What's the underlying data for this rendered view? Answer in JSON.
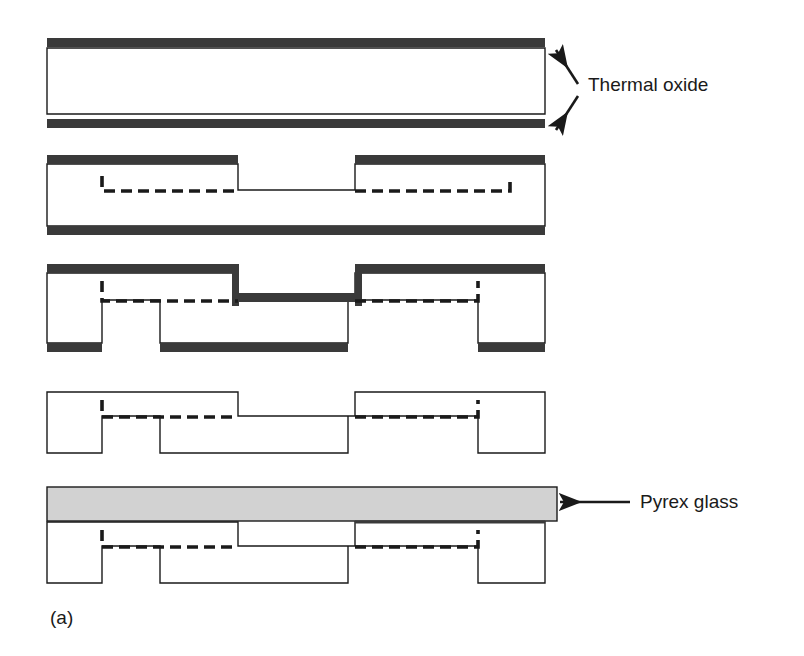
{
  "figure": {
    "caption": "(a)",
    "panel_count": 5
  },
  "annotations": [
    {
      "id": "thermal-oxide",
      "label": "Thermal oxide",
      "text_x": 588,
      "text_y": 91,
      "arrows": [
        {
          "x1": 578,
          "y1": 84,
          "x2": 556,
          "y2": 50
        },
        {
          "x1": 578,
          "y1": 96,
          "x2": 556,
          "y2": 130
        }
      ]
    },
    {
      "id": "pyrex-glass",
      "label": "Pyrex glass",
      "text_x": 640,
      "text_y": 508,
      "arrows": [
        {
          "x1": 630,
          "y1": 502,
          "x2": 560,
          "y2": 502
        }
      ]
    }
  ],
  "colors": {
    "oxide": "#3a3a3a",
    "glass": "#d2d2d2",
    "outline": "#1a1a1a",
    "background": "#ffffff",
    "text": "#1a1a1a"
  },
  "geometry": {
    "left": 47,
    "right": 545,
    "oxide_thickness": 9,
    "line_width": 1.4,
    "dash_pattern": "11,6",
    "dash_width": 3.6
  },
  "panels": [
    {
      "index": 1,
      "name": "panel-thermal-oxidation",
      "step": "Thermal oxidation of bare silicon wafer",
      "top_oxide_y": 38,
      "body_top_y": 48,
      "body_bottom_y": 114,
      "bottom_oxide_y": 119,
      "top_oxide_segments": [
        [
          47,
          545
        ]
      ],
      "bottom_oxide_segments": [
        [
          47,
          545
        ]
      ],
      "silicon_outline": "M47,48 L545,48 L545,114 L47,114 Z",
      "dashed_paths": []
    },
    {
      "index": 2,
      "name": "panel-oxide-patterning",
      "step": "Photolithographic patterning and opening of top oxide window",
      "top_oxide_y": 155,
      "body_top_y": 164,
      "body_bottom_y": 226,
      "bottom_oxide_y": 226,
      "top_oxide_segments": [
        [
          47,
          238
        ],
        [
          355,
          545
        ]
      ],
      "bottom_oxide_segments": [
        [
          47,
          545
        ]
      ],
      "silicon_outline": "M47,164 L238,164 L238,190 L355,190 L355,164 L545,164 L545,226 L47,226 Z",
      "dashed_paths": [
        "M102,176 L102,191 L238,191",
        "M355,191 L510,191 L510,176"
      ]
    },
    {
      "index": 3,
      "name": "panel-double-sided-etch",
      "step": "Double-sided anisotropic etch forming top recess and backside wells",
      "top_oxide_y": 264,
      "body_top_y": 273,
      "body_bottom_y": 343,
      "bottom_oxide_y": 343,
      "top_oxide_segments": [
        [
          47,
          238
        ],
        [
          355,
          545
        ]
      ],
      "bottom_oxide_segments": [
        [
          47,
          102
        ],
        [
          160,
          348
        ],
        [
          478,
          545
        ]
      ],
      "silicon_outline": "M47,273 L238,273 L238,300 L355,300 L355,273 L545,273 L545,343 L478,343 L478,300 L348,300 L348,343 L160,343 L160,300 L102,300 L102,343 L47,343 Z",
      "dashed_paths": [
        "M102,281 L102,301 L238,301",
        "M355,301 L478,301 L478,281"
      ]
    },
    {
      "index": 4,
      "name": "panel-oxide-strip",
      "step": "Oxide removal leaving shaped silicon structure",
      "body_top_y": 392,
      "body_bottom_y": 453,
      "top_oxide_segments": [],
      "bottom_oxide_segments": [],
      "silicon_outline": "M47,392 L238,392 L238,416 L355,416 L355,392 L545,392 L545,453 L478,453 L478,416 L348,416 L348,453 L160,453 L160,416 L102,416 L102,453 L47,453 Z",
      "dashed_paths": [
        "M102,400 L102,417 L238,417",
        "M355,417 L478,417 L478,400"
      ]
    },
    {
      "index": 5,
      "name": "panel-anodic-bonding",
      "step": "Anodic bonding of Pyrex glass cover to silicon",
      "glass_top_y": 487,
      "glass_bottom_y": 521,
      "glass_left": 47,
      "glass_right": 557,
      "body_top_y": 522,
      "body_bottom_y": 583,
      "silicon_outline": "M47,522 L238,522 L238,546 L355,546 L355,522 L545,522 L545,583 L478,583 L478,546 L348,546 L348,583 L160,583 L160,546 L102,546 L102,583 L47,583 Z",
      "bond_line": "M355,522 L545,522",
      "dashed_paths": [
        "M102,530 L102,547 L238,547",
        "M355,547 L478,547 L478,530"
      ]
    }
  ]
}
